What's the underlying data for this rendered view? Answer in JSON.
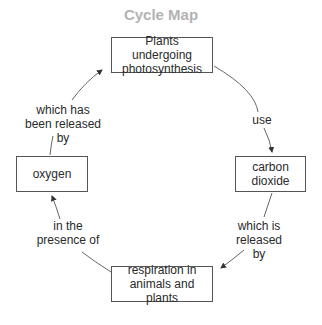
{
  "title": "Cycle Map",
  "nodes": {
    "top": "Plants undergoing photosynthesis",
    "right": "carbon dioxide",
    "bottom": "respiration in animals and plants",
    "left": "oxygen"
  },
  "links": {
    "top_to_right": "use",
    "right_to_bottom": "which is released by",
    "bottom_to_left": "in the presence of",
    "left_to_top": "which has been released by"
  },
  "colors": {
    "title": "#b3b3b3",
    "stroke": "#555555",
    "text": "#2a2a2a"
  }
}
